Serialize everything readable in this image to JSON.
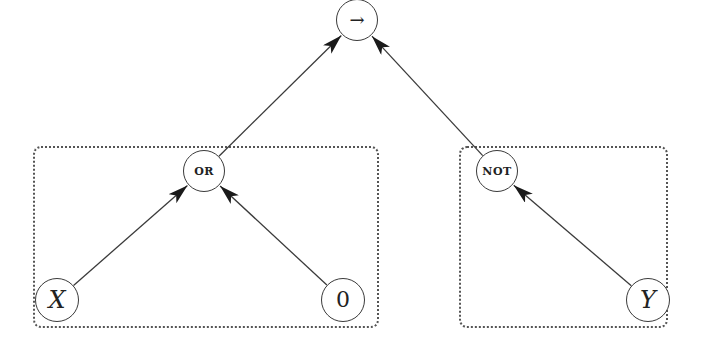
{
  "diagram": {
    "type": "expression-tree",
    "colors": {
      "edge": "#3a3a3a",
      "node_border": "#3a3a3a",
      "box_border": "#555555",
      "background": "#ffffff"
    },
    "nodes": [
      {
        "id": "imp",
        "label": "→",
        "x": 357,
        "y": 20,
        "r": 21,
        "style": "arrowsym"
      },
      {
        "id": "or",
        "label": "OR",
        "x": 204,
        "y": 171,
        "r": 21,
        "style": "smallcaps"
      },
      {
        "id": "not",
        "label": "NOT",
        "x": 497,
        "y": 171,
        "r": 21,
        "style": "smallcaps"
      },
      {
        "id": "x",
        "label": "X",
        "x": 57,
        "y": 300,
        "r": 22,
        "style": "italic"
      },
      {
        "id": "zero",
        "label": "0",
        "x": 343,
        "y": 300,
        "r": 22,
        "style": "plain"
      },
      {
        "id": "y",
        "label": "Y",
        "x": 648,
        "y": 300,
        "r": 22,
        "style": "italic"
      }
    ],
    "edges": [
      {
        "from": "or",
        "to": "imp"
      },
      {
        "from": "not",
        "to": "imp"
      },
      {
        "from": "x",
        "to": "or"
      },
      {
        "from": "zero",
        "to": "or"
      },
      {
        "from": "y",
        "to": "not"
      }
    ],
    "groups": [
      {
        "id": "left-group",
        "contains": [
          "or",
          "x",
          "zero"
        ],
        "x": 33,
        "y": 146,
        "w": 346,
        "h": 182
      },
      {
        "id": "right-group",
        "contains": [
          "not",
          "y"
        ],
        "x": 459,
        "y": 146,
        "w": 209,
        "h": 182
      }
    ]
  }
}
